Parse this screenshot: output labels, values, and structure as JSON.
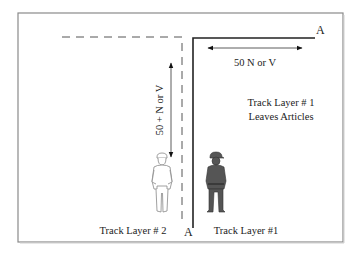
{
  "diagram": {
    "colors": {
      "frame": "#8a8a8a",
      "line": "#222222",
      "dashed": "#555555",
      "figure_dark": "#555555",
      "figure_outline": "#888888"
    },
    "point_labels": {
      "top_right": "A",
      "bottom": "A"
    },
    "dimensions": {
      "horizontal": "50 N or V",
      "vertical": "50 + N or V"
    },
    "notes": {
      "line1": "Track Layer # 1",
      "line2": "Leaves Articles"
    },
    "figures": [
      {
        "name": "track-layer-2",
        "label": "Track Layer # 2",
        "style": "outline"
      },
      {
        "name": "track-layer-1",
        "label": "Track Layer #1",
        "style": "filled"
      }
    ]
  }
}
